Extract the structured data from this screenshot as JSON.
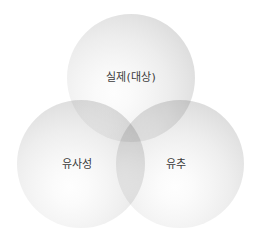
{
  "diagram": {
    "type": "venn",
    "circle_count": 3,
    "background_color": "#ffffff",
    "label_color": "#3b3b3b",
    "circles": [
      {
        "id": "top",
        "label": "실제(대상)",
        "position": "top",
        "fill_light": "#fdfdfd",
        "fill_edge": "#c4c4c4"
      },
      {
        "id": "left",
        "label": "유사성",
        "position": "bottom-left",
        "fill_light": "#fefefe",
        "fill_edge": "#c5c5c5"
      },
      {
        "id": "right",
        "label": "유추",
        "position": "bottom-right",
        "fill_light": "#fefefe",
        "fill_edge": "#c5c5c5"
      }
    ]
  }
}
